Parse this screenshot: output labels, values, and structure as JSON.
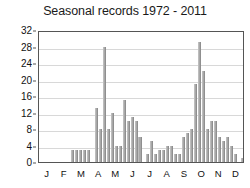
{
  "chart_data": {
    "type": "bar",
    "title": "Seasonal records 1972 - 2011",
    "xlabel": "",
    "ylabel": "",
    "ylim": [
      0,
      32
    ],
    "yticks": [
      0,
      4,
      8,
      12,
      16,
      20,
      24,
      28,
      32
    ],
    "ytick_labels": [
      "0",
      "4",
      "8",
      "12",
      "16",
      "20",
      "24",
      "28",
      "32"
    ],
    "grid": true,
    "legend": null,
    "bar_color": "#a8a8a8",
    "month_labels": [
      "J",
      "F",
      "M",
      "A",
      "M",
      "J",
      "J",
      "A",
      "S",
      "O",
      "N",
      "D"
    ],
    "xlabel_note": "Months of the year, January through December",
    "bin_description": "One bar per pentad/week bin across the calendar year (52 bins)",
    "categories": [
      1,
      2,
      3,
      4,
      5,
      6,
      7,
      8,
      9,
      10,
      11,
      12,
      13,
      14,
      15,
      16,
      17,
      18,
      19,
      20,
      21,
      22,
      23,
      24,
      25,
      26,
      27,
      28,
      29,
      30,
      31,
      32,
      33,
      34,
      35,
      36,
      37,
      38,
      39,
      40,
      41,
      42,
      43,
      44,
      45,
      46,
      47,
      48,
      49,
      50,
      51,
      52
    ],
    "values": [
      0,
      0,
      0,
      0,
      0,
      0,
      0,
      0,
      3,
      3,
      3,
      3,
      3,
      0,
      13,
      8,
      28,
      8,
      12,
      4,
      4,
      15,
      10,
      11,
      10,
      6,
      0,
      2,
      5,
      2,
      3,
      3,
      4,
      4,
      2,
      2,
      6,
      7,
      8,
      19,
      29,
      22,
      8,
      10,
      10,
      6,
      5,
      6,
      4,
      2,
      0,
      1
    ],
    "peaks": [
      {
        "index": 17,
        "value": 28,
        "month": "A"
      },
      {
        "index": 41,
        "value": 29,
        "month": "A"
      },
      {
        "index": 42,
        "value": 22,
        "month": "A"
      },
      {
        "index": 40,
        "value": 19,
        "month": "A"
      }
    ],
    "trailing_bars": [
      {
        "index": 49,
        "value": 6,
        "month": "N"
      },
      {
        "index": 50,
        "value": 2,
        "month": "N"
      },
      {
        "index": 51,
        "value": 1,
        "month": "N"
      },
      {
        "index": 52,
        "value": 1,
        "month": "D"
      }
    ]
  },
  "axis": {
    "y_ticks": [
      "32",
      "28",
      "24",
      "20",
      "16",
      "12",
      "8",
      "4",
      "0"
    ],
    "x_ticks": [
      "J",
      "F",
      "M",
      "A",
      "M",
      "J",
      "J",
      "A",
      "S",
      "O",
      "N",
      "D"
    ]
  }
}
